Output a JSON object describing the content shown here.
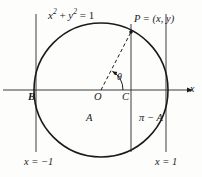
{
  "figure": {
    "type": "geometry-diagram",
    "background_color": "#fdfdfc",
    "stroke_color": "#1a1a1a",
    "labels": {
      "equation_lhs": "x",
      "equation_exp1": "2",
      "equation_plus": " + ",
      "equation_var2": "y",
      "equation_exp2": "2",
      "equation_rhs": " = 1",
      "point_p": "P = (x, y)",
      "point_b": "B",
      "point_o": "O",
      "point_c": "C",
      "angle_theta": "θ",
      "axis_x": "x",
      "region_a": "A",
      "region_pi_minus_a": "π − A",
      "line_left": "x = −1",
      "line_right": "x = 1"
    },
    "geometry": {
      "origin": {
        "x": 101,
        "y": 90
      },
      "radius": 67,
      "axis_y": 90,
      "vertical_line_left_x": 36,
      "vertical_line_chord_x": 131,
      "vertical_line_right_x": 166,
      "point_p": {
        "x": 131,
        "y": 32
      },
      "point_b": {
        "x": 36,
        "y": 90
      },
      "point_c": {
        "x": 131,
        "y": 90
      },
      "arrow_x_end": 196,
      "theta_degrees": 62,
      "arc_radius": 22
    }
  }
}
